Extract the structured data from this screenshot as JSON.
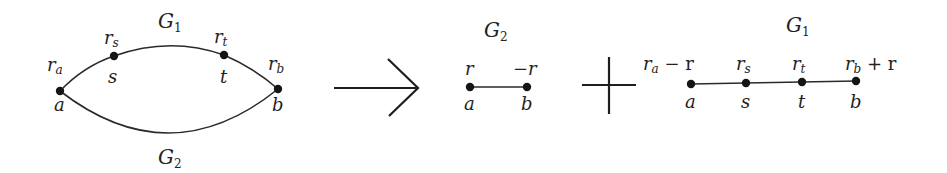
{
  "diagram": {
    "left_graph": {
      "top_label": {
        "main": "G",
        "sub": "1"
      },
      "bottom_label": {
        "main": "G",
        "sub": "2"
      },
      "nodes": [
        {
          "id": "a",
          "name": "a",
          "value_main": "r",
          "value_sub": "a"
        },
        {
          "id": "s",
          "name": "s",
          "value_main": "r",
          "value_sub": "s"
        },
        {
          "id": "t",
          "name": "t",
          "value_main": "r",
          "value_sub": "t"
        },
        {
          "id": "b",
          "name": "b",
          "value_main": "r",
          "value_sub": "b"
        }
      ],
      "edges": [
        {
          "from": "a",
          "to": "s",
          "path": "G1"
        },
        {
          "from": "s",
          "to": "t",
          "path": "G1"
        },
        {
          "from": "t",
          "to": "b",
          "path": "G1"
        },
        {
          "from": "a",
          "to": "b",
          "path": "G2"
        }
      ]
    },
    "operator_arrow": "→",
    "middle_graph": {
      "label": {
        "main": "G",
        "sub": "2"
      },
      "nodes": [
        {
          "id": "a",
          "name": "a",
          "value": "r"
        },
        {
          "id": "b",
          "name": "b",
          "value": "−r"
        }
      ],
      "edges": [
        {
          "from": "a",
          "to": "b"
        }
      ]
    },
    "operator_plus": "+",
    "right_graph": {
      "label": {
        "main": "G",
        "sub": "1"
      },
      "nodes": [
        {
          "id": "a",
          "name": "a",
          "value_main": "r",
          "value_sub": "a",
          "value_suffix": " − r"
        },
        {
          "id": "s",
          "name": "s",
          "value_main": "r",
          "value_sub": "s",
          "value_suffix": ""
        },
        {
          "id": "t",
          "name": "t",
          "value_main": "r",
          "value_sub": "t",
          "value_suffix": ""
        },
        {
          "id": "b",
          "name": "b",
          "value_main": "r",
          "value_sub": "b",
          "value_suffix": " + r"
        }
      ],
      "edges": [
        {
          "from": "a",
          "to": "s"
        },
        {
          "from": "s",
          "to": "t"
        },
        {
          "from": "t",
          "to": "b"
        }
      ]
    }
  }
}
